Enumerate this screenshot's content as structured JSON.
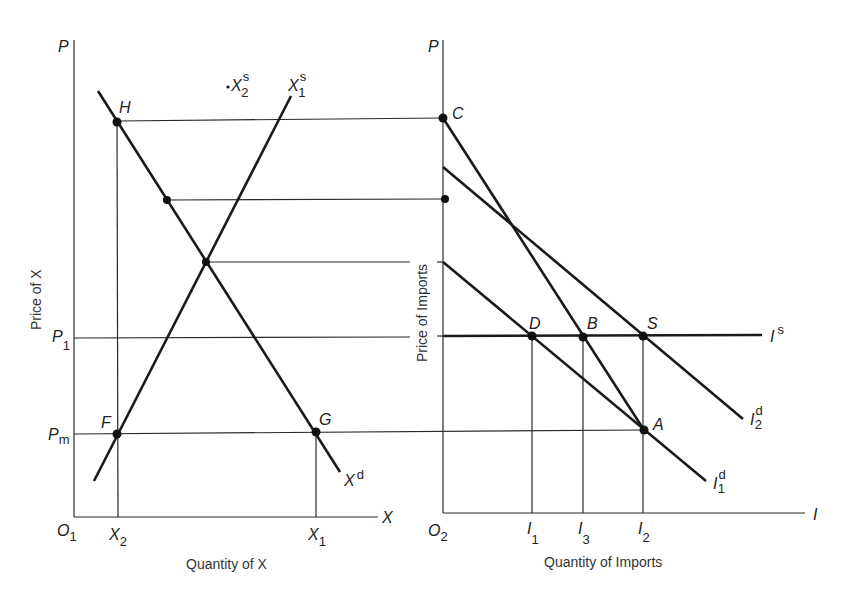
{
  "left_panel": {
    "y_axis_label": "P",
    "x_axis_label": "X",
    "origin_label": "O",
    "origin_sub": "1",
    "axis_title_x": "Quantity of X",
    "axis_title_y": "Price of X",
    "price_levels": [
      {
        "label": "P",
        "sub": "1"
      },
      {
        "label": "P",
        "sub": "m"
      }
    ],
    "quantity_ticks": [
      {
        "label": "X",
        "sub": "2"
      },
      {
        "label": "X",
        "sub": "1"
      }
    ],
    "points": [
      "H",
      "F",
      "G"
    ],
    "curves": {
      "demand": {
        "label": "X",
        "sup": "d"
      },
      "supply1": {
        "label": "X",
        "sup": "s",
        "sub": "1"
      },
      "supply2": {
        "label": "X",
        "sup": "s",
        "sub": "2"
      }
    }
  },
  "right_panel": {
    "y_axis_label": "P",
    "x_axis_label": "I",
    "origin_label": "O",
    "origin_sub": "2",
    "axis_title_x": "Quantity of Imports",
    "axis_title_y": "Price of Imports",
    "quantity_ticks": [
      {
        "label": "I",
        "sub": "1"
      },
      {
        "label": "I",
        "sub": "3"
      },
      {
        "label": "I",
        "sub": "2"
      }
    ],
    "points": [
      "C",
      "D",
      "B",
      "S",
      "A"
    ],
    "curves": {
      "import_supply": {
        "label": "I",
        "sup": "s"
      },
      "import_demand1": {
        "label": "I",
        "sup": "d",
        "sub": "1"
      },
      "import_demand2": {
        "label": "I",
        "sup": "d",
        "sub": "2"
      }
    }
  }
}
